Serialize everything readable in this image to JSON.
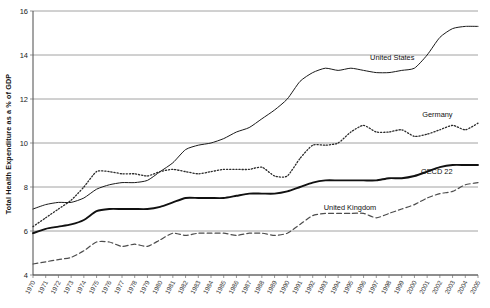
{
  "chart_data": {
    "type": "line",
    "title": "",
    "xlabel": "",
    "ylabel": "Total Health Expenditure as a % of GDP",
    "ylim": [
      4,
      16
    ],
    "xlim": [
      1970,
      2005
    ],
    "yticks": [
      4,
      6,
      8,
      10,
      12,
      14,
      16
    ],
    "grid": true,
    "legend_position": "inline-right",
    "x": [
      1970,
      1971,
      1972,
      1973,
      1974,
      1975,
      1976,
      1977,
      1978,
      1979,
      1980,
      1981,
      1982,
      1983,
      1984,
      1985,
      1986,
      1987,
      1988,
      1989,
      1990,
      1991,
      1992,
      1993,
      1994,
      1995,
      1996,
      1997,
      1998,
      1999,
      2000,
      2001,
      2002,
      2003,
      2004,
      2005
    ],
    "categories": [
      "1970",
      "1971",
      "1972",
      "1973",
      "1974",
      "1975",
      "1976",
      "1977",
      "1978",
      "1979",
      "1980",
      "1981",
      "1982",
      "1983",
      "1984",
      "1985",
      "1986",
      "1987",
      "1988",
      "1989",
      "1990",
      "1991",
      "1992",
      "1993",
      "1994",
      "1995",
      "1996",
      "1997",
      "1998",
      "1999",
      "2000",
      "2001",
      "2002",
      "2003",
      "2004",
      "2005"
    ],
    "series": [
      {
        "name": "United States",
        "style": "solid-thin",
        "color": "#1a1a1a",
        "label_year": 2000,
        "values": [
          7.0,
          7.2,
          7.3,
          7.3,
          7.5,
          7.9,
          8.1,
          8.2,
          8.2,
          8.3,
          8.7,
          9.1,
          9.7,
          9.9,
          10.0,
          10.2,
          10.5,
          10.7,
          11.1,
          11.5,
          12.0,
          12.8,
          13.2,
          13.4,
          13.3,
          13.4,
          13.3,
          13.2,
          13.2,
          13.3,
          13.4,
          14.0,
          14.8,
          15.2,
          15.3,
          15.3
        ]
      },
      {
        "name": "Germany",
        "style": "dotted",
        "color": "#2b2b2b",
        "label_year": 2003,
        "values": [
          6.2,
          6.6,
          7.0,
          7.4,
          8.0,
          8.7,
          8.7,
          8.6,
          8.6,
          8.5,
          8.7,
          8.8,
          8.7,
          8.6,
          8.7,
          8.8,
          8.8,
          8.8,
          8.9,
          8.5,
          8.5,
          9.3,
          9.9,
          9.9,
          10.0,
          10.5,
          10.8,
          10.5,
          10.5,
          10.6,
          10.3,
          10.4,
          10.6,
          10.8,
          10.6,
          10.9
        ]
      },
      {
        "name": "OECD 22",
        "style": "solid-thick",
        "color": "#111111",
        "label_year": 2003,
        "values": [
          5.9,
          6.1,
          6.2,
          6.3,
          6.5,
          6.9,
          7.0,
          7.0,
          7.0,
          7.0,
          7.1,
          7.3,
          7.5,
          7.5,
          7.5,
          7.5,
          7.6,
          7.7,
          7.7,
          7.7,
          7.8,
          8.0,
          8.2,
          8.3,
          8.3,
          8.3,
          8.3,
          8.3,
          8.4,
          8.4,
          8.5,
          8.7,
          8.9,
          9.0,
          9.0,
          9.0
        ]
      },
      {
        "name": "United Kingdom",
        "style": "dashed",
        "color": "#4d4d4d",
        "label_year": 1997,
        "values": [
          4.5,
          4.6,
          4.7,
          4.8,
          5.1,
          5.5,
          5.5,
          5.3,
          5.4,
          5.3,
          5.6,
          5.9,
          5.8,
          5.9,
          5.9,
          5.9,
          5.8,
          5.9,
          5.9,
          5.8,
          5.9,
          6.3,
          6.7,
          6.8,
          6.8,
          6.8,
          6.8,
          6.6,
          6.8,
          7.0,
          7.2,
          7.5,
          7.7,
          7.8,
          8.1,
          8.2
        ]
      }
    ]
  },
  "axis": {
    "y_title": "Total Health Expenditure as a % of GDP",
    "y_tick_labels": [
      "16",
      "14",
      "12",
      "10",
      "8",
      "6",
      "4"
    ]
  },
  "series_labels": {
    "united_states": "United States",
    "germany": "Germany",
    "oecd22": "OECD 22",
    "united_kingdom": "United Kingdom"
  }
}
